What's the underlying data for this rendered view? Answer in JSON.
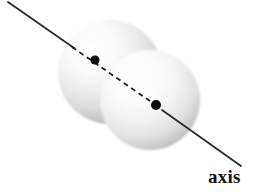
{
  "figure": {
    "kind": "diatomic-molecule-rotation-axis-diagram",
    "background_color": "#ffffff",
    "label": "axis",
    "label_color": "#121212",
    "atoms": [
      {
        "name": "atom-upper-left",
        "center_x": 110,
        "center_y": 72,
        "radius": 52,
        "nucleus_x": 95,
        "nucleus_y": 60,
        "nucleus_radius": 4.5,
        "nucleus_color": "#0d0d0d",
        "highlight_color": "#ffffff",
        "mid_color": "#e6e6e6",
        "edge_color": "#9a9a9a"
      },
      {
        "name": "atom-lower-right",
        "center_x": 150,
        "center_y": 100,
        "radius": 50,
        "nucleus_x": 156,
        "nucleus_y": 105,
        "nucleus_radius": 5,
        "nucleus_color": "#0d0d0d",
        "highlight_color": "#ffffff",
        "mid_color": "#e9e9e9",
        "edge_color": "#9e9e9e"
      }
    ],
    "axis_line": {
      "name": "rotation-axis",
      "start_x": 8,
      "start_y": 2,
      "end_x": 241,
      "end_y": 166,
      "color": "#2b2b2b",
      "width": 1.8,
      "dashed_from_x": 72,
      "dashed_from_y": 47,
      "dashed_to_x": 158,
      "dashed_to_y": 107,
      "dash_pattern": "5 4"
    }
  }
}
